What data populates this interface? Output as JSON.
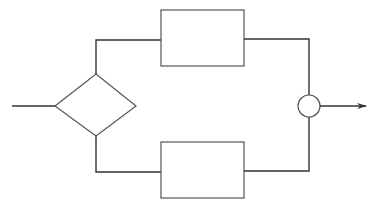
{
  "diagram": {
    "type": "flowchart",
    "colors": {
      "line": "#333333",
      "shape_stroke": "#555555",
      "background": "#ffffff"
    },
    "nodes": [
      {
        "id": "input",
        "shape": "line-start",
        "label": ""
      },
      {
        "id": "decision",
        "shape": "diamond",
        "label": ""
      },
      {
        "id": "process-top",
        "shape": "rectangle",
        "label": ""
      },
      {
        "id": "process-bottom",
        "shape": "rectangle",
        "label": ""
      },
      {
        "id": "junction",
        "shape": "circle",
        "label": ""
      },
      {
        "id": "output",
        "shape": "arrow-end",
        "label": ""
      }
    ],
    "edges": [
      {
        "from": "input",
        "to": "decision"
      },
      {
        "from": "decision",
        "to": "process-top"
      },
      {
        "from": "decision",
        "to": "process-bottom"
      },
      {
        "from": "process-top",
        "to": "junction"
      },
      {
        "from": "process-bottom",
        "to": "junction"
      },
      {
        "from": "junction",
        "to": "output"
      }
    ]
  }
}
